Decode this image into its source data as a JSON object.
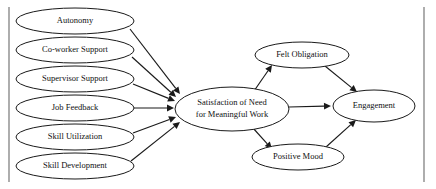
{
  "figure": {
    "type": "path-model-diagram",
    "title": "",
    "background_color": "#ffffff",
    "node_stroke_color": "#1a1a1a",
    "node_fill_color": "#ffffff",
    "edge_color": "#1a1a1a",
    "frame_color": "#6b6b6b"
  },
  "frame": {
    "left_rule": {
      "x": 9,
      "y1": 7,
      "y2": 182
    },
    "right_rule": {
      "x": 424,
      "y1": 7,
      "y2": 182
    }
  },
  "nodes": {
    "antecedents": [
      {
        "id": "autonomy",
        "label": "Autonomy",
        "cx": 75,
        "cy": 21,
        "rx": 59,
        "ry": 13,
        "font_size": 8.5
      },
      {
        "id": "coworker-support",
        "label": "Co-worker Support",
        "cx": 75,
        "cy": 50,
        "rx": 59,
        "ry": 13,
        "font_size": 8.5
      },
      {
        "id": "supervisor-support",
        "label": "Supervisor Support",
        "cx": 75,
        "cy": 79,
        "rx": 59,
        "ry": 13,
        "font_size": 8.5
      },
      {
        "id": "job-feedback",
        "label": "Job Feedback",
        "cx": 75,
        "cy": 108,
        "rx": 59,
        "ry": 13,
        "font_size": 8.5
      },
      {
        "id": "skill-utilization",
        "label": "Skill Utilization",
        "cx": 75,
        "cy": 137,
        "rx": 59,
        "ry": 13,
        "font_size": 8.5
      },
      {
        "id": "skill-development",
        "label": "Skill Development",
        "cx": 75,
        "cy": 166,
        "rx": 59,
        "ry": 13,
        "font_size": 8.5
      }
    ],
    "mediator": {
      "id": "satisfaction-of-need",
      "label_line1": "Satisfaction of Need",
      "label_line2": "for Meaningful Work",
      "cx": 232,
      "cy": 109,
      "rx": 57,
      "ry": 22,
      "font_size": 8.5
    },
    "felt_obligation": {
      "id": "felt-obligation",
      "label": "Felt Obligation",
      "cx": 302,
      "cy": 55,
      "rx": 47,
      "ry": 13,
      "font_size": 8.5
    },
    "positive_mood": {
      "id": "positive-mood",
      "label": "Positive Mood",
      "cx": 298,
      "cy": 157,
      "rx": 46,
      "ry": 13,
      "font_size": 8.5
    },
    "outcome": {
      "id": "engagement",
      "label": "Engagement",
      "cx": 374,
      "cy": 106,
      "rx": 41,
      "ry": 16,
      "font_size": 8.5
    }
  },
  "edges": [
    {
      "id": "autonomy-to-satisfaction",
      "from": "autonomy",
      "to": "satisfaction-of-need",
      "x1": 130,
      "y1": 29,
      "x2": 180,
      "y2": 94,
      "arrow": true
    },
    {
      "id": "coworker-to-satisfaction",
      "from": "coworker-support",
      "to": "satisfaction-of-need",
      "x1": 132,
      "y1": 57,
      "x2": 176,
      "y2": 97,
      "arrow": true
    },
    {
      "id": "supervisor-to-satisfaction",
      "from": "supervisor-support",
      "to": "satisfaction-of-need",
      "x1": 133,
      "y1": 84,
      "x2": 175,
      "y2": 101,
      "arrow": true
    },
    {
      "id": "job-feedback-to-satisfaction",
      "from": "job-feedback",
      "to": "satisfaction-of-need",
      "x1": 134,
      "y1": 108,
      "x2": 174,
      "y2": 108,
      "arrow": true
    },
    {
      "id": "skill-utilization-to-satisfaction",
      "from": "skill-utilization",
      "to": "satisfaction-of-need",
      "x1": 133,
      "y1": 133,
      "x2": 176,
      "y2": 117,
      "arrow": true
    },
    {
      "id": "skill-development-to-satisfaction",
      "from": "skill-development",
      "to": "satisfaction-of-need",
      "x1": 131,
      "y1": 161,
      "x2": 180,
      "y2": 122,
      "arrow": true
    },
    {
      "id": "satisfaction-to-felt-obligation",
      "from": "satisfaction-of-need",
      "to": "felt-obligation",
      "x1": 254,
      "y1": 91,
      "x2": 272,
      "y2": 65,
      "arrow": true
    },
    {
      "id": "satisfaction-to-positive-mood",
      "from": "satisfaction-of-need",
      "to": "positive-mood",
      "x1": 253,
      "y1": 128,
      "x2": 272,
      "y2": 149,
      "arrow": true
    },
    {
      "id": "satisfaction-to-engagement",
      "from": "satisfaction-of-need",
      "to": "engagement",
      "x1": 289,
      "y1": 107,
      "x2": 331,
      "y2": 106,
      "arrow": true
    },
    {
      "id": "felt-obligation-to-engagement",
      "from": "felt-obligation",
      "to": "engagement",
      "x1": 325,
      "y1": 66,
      "x2": 357,
      "y2": 92,
      "arrow": true
    },
    {
      "id": "positive-mood-to-engagement",
      "from": "positive-mood",
      "to": "engagement",
      "x1": 326,
      "y1": 147,
      "x2": 356,
      "y2": 120,
      "arrow": true
    }
  ],
  "chart_data": {
    "type": "diagram",
    "diagram_kind": "structural-equation-path-model",
    "title": "",
    "levels": [
      {
        "name": "Job Resources (Antecedents)",
        "nodes": [
          "Autonomy",
          "Co-worker Support",
          "Supervisor Support",
          "Job Feedback",
          "Skill Utilization",
          "Skill Development"
        ]
      },
      {
        "name": "Mediator",
        "nodes": [
          "Satisfaction of Need for Meaningful Work"
        ]
      },
      {
        "name": "Secondary Mediators",
        "nodes": [
          "Felt Obligation",
          "Positive Mood"
        ]
      },
      {
        "name": "Outcome",
        "nodes": [
          "Engagement"
        ]
      }
    ],
    "relationships": [
      {
        "source": "Autonomy",
        "target": "Satisfaction of Need for Meaningful Work"
      },
      {
        "source": "Co-worker Support",
        "target": "Satisfaction of Need for Meaningful Work"
      },
      {
        "source": "Supervisor Support",
        "target": "Satisfaction of Need for Meaningful Work"
      },
      {
        "source": "Job Feedback",
        "target": "Satisfaction of Need for Meaningful Work"
      },
      {
        "source": "Skill Utilization",
        "target": "Satisfaction of Need for Meaningful Work"
      },
      {
        "source": "Skill Development",
        "target": "Satisfaction of Need for Meaningful Work"
      },
      {
        "source": "Satisfaction of Need for Meaningful Work",
        "target": "Felt Obligation"
      },
      {
        "source": "Satisfaction of Need for Meaningful Work",
        "target": "Positive Mood"
      },
      {
        "source": "Satisfaction of Need for Meaningful Work",
        "target": "Engagement"
      },
      {
        "source": "Felt Obligation",
        "target": "Engagement"
      },
      {
        "source": "Positive Mood",
        "target": "Engagement"
      }
    ]
  }
}
